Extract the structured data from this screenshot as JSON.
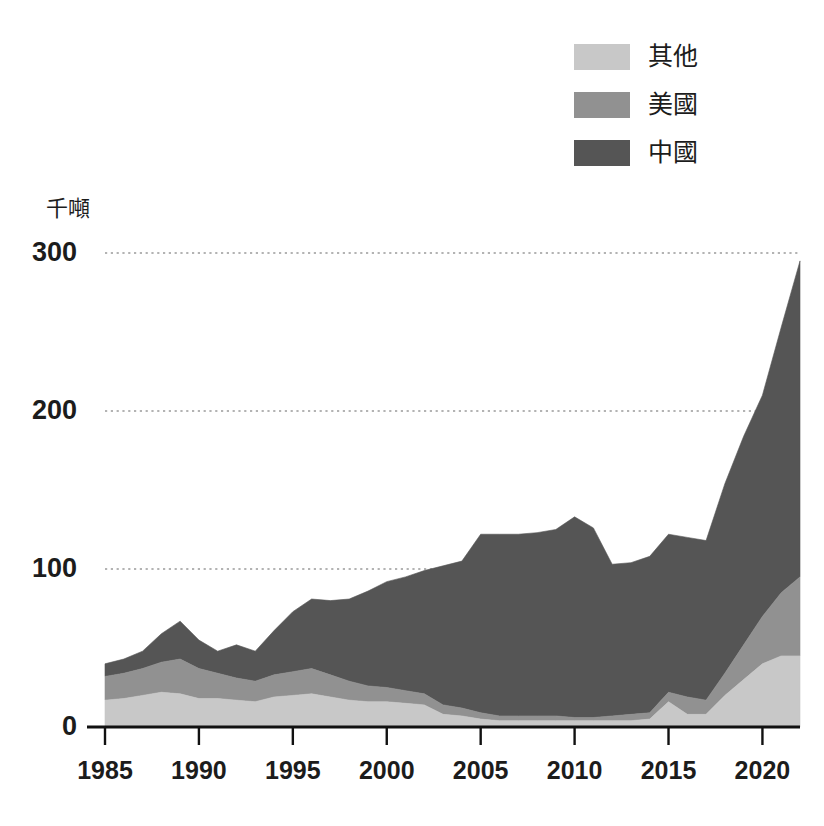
{
  "chart_data": {
    "type": "area",
    "stacked": true,
    "title": "",
    "subtitle": "",
    "xlabel": "",
    "ylabel": "千噸",
    "unit_label": "千噸",
    "xlim": [
      1985,
      2022
    ],
    "ylim": [
      0,
      300
    ],
    "y_ticks": [
      0,
      100,
      200,
      300
    ],
    "x_ticks": [
      1985,
      1990,
      1995,
      2000,
      2005,
      2010,
      2015,
      2020
    ],
    "x_tick_labels": [
      "1985",
      "1990",
      "1995",
      "2000",
      "2005",
      "2010",
      "2015",
      "2020"
    ],
    "y_tick_labels": [
      "0",
      "100",
      "200",
      "300"
    ],
    "grid": "horizontal-dotted",
    "legend_position": "top-right",
    "legend": [
      "其他",
      "美國",
      "中國"
    ],
    "x": [
      1985,
      1986,
      1987,
      1988,
      1989,
      1990,
      1991,
      1992,
      1993,
      1994,
      1995,
      1996,
      1997,
      1998,
      1999,
      2000,
      2001,
      2002,
      2003,
      2004,
      2005,
      2006,
      2007,
      2008,
      2009,
      2010,
      2011,
      2012,
      2013,
      2014,
      2015,
      2016,
      2017,
      2018,
      2019,
      2020,
      2021,
      2022
    ],
    "series": [
      {
        "name": "中國",
        "color": "#555555",
        "values": [
          8,
          9,
          11,
          18,
          24,
          18,
          14,
          21,
          19,
          28,
          38,
          44,
          47,
          52,
          60,
          67,
          72,
          78,
          88,
          93,
          113,
          115,
          115,
          116,
          118,
          127,
          120,
          96,
          96,
          99,
          100,
          101,
          101,
          120,
          132,
          140,
          168,
          200
        ]
      },
      {
        "name": "美國",
        "color": "#919191",
        "values": [
          15,
          16,
          17,
          19,
          22,
          19,
          16,
          14,
          13,
          14,
          15,
          16,
          14,
          12,
          10,
          9,
          8,
          7,
          6,
          5,
          4,
          3,
          3,
          3,
          3,
          2,
          2,
          3,
          4,
          4,
          6,
          11,
          9,
          14,
          22,
          30,
          40,
          50
        ]
      },
      {
        "name": "其他",
        "color": "#c8c8c8",
        "values": [
          17,
          18,
          20,
          22,
          21,
          18,
          18,
          17,
          16,
          19,
          20,
          21,
          19,
          17,
          16,
          16,
          15,
          14,
          8,
          7,
          5,
          4,
          4,
          4,
          4,
          4,
          4,
          4,
          4,
          5,
          16,
          8,
          8,
          20,
          30,
          40,
          45,
          45
        ]
      }
    ],
    "totals": [
      40,
      43,
      48,
      59,
      67,
      55,
      48,
      52,
      48,
      61,
      73,
      81,
      80,
      81,
      86,
      92,
      95,
      99,
      102,
      105,
      122,
      122,
      122,
      123,
      125,
      133,
      126,
      103,
      104,
      108,
      122,
      120,
      118,
      154,
      184,
      210,
      253,
      295
    ],
    "colors": {
      "other": "#c8c8c8",
      "usa": "#919191",
      "china": "#555555",
      "axis": "#111111",
      "grid": "#9a9a9a",
      "text": "#1c1c1c",
      "background": "#ffffff"
    }
  },
  "legend": {
    "items": [
      {
        "label": "其他",
        "color": "#c8c8c8",
        "icon": "legend-swatch-other"
      },
      {
        "label": "美國",
        "color": "#919191",
        "icon": "legend-swatch-usa"
      },
      {
        "label": "中國",
        "color": "#555555",
        "icon": "legend-swatch-china"
      }
    ]
  },
  "axes": {
    "y_unit": "千噸",
    "y_labels": [
      "300",
      "200",
      "100",
      "0"
    ],
    "x_labels": [
      "1985",
      "1990",
      "1995",
      "2000",
      "2005",
      "2010",
      "2015",
      "2020"
    ]
  }
}
